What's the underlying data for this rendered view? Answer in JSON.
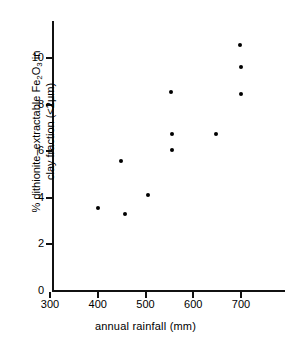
{
  "chart_data": {
    "type": "scatter",
    "title": "",
    "xlabel": "annual rainfall (mm)",
    "ylabel_line1": "% dithionite-extractable Fe2O3 in",
    "ylabel_line2": "clay fraction (<2μm)",
    "xlim": [
      280,
      770
    ],
    "ylim": [
      0,
      11.6
    ],
    "xticks": [
      300,
      400,
      500,
      600,
      700
    ],
    "xtick_labels": [
      "300",
      "400",
      "500",
      "600",
      "700"
    ],
    "yticks": [
      0,
      2,
      4,
      6,
      8,
      10
    ],
    "ytick_labels": [
      "0",
      "2",
      "4",
      "6",
      "8",
      "10"
    ],
    "grid": false,
    "legend": false,
    "marker": "filled-circle",
    "marker_color": "#000000",
    "points": [
      {
        "x": 400,
        "y": 3.55
      },
      {
        "x": 449,
        "y": 5.6
      },
      {
        "x": 458,
        "y": 3.3
      },
      {
        "x": 505,
        "y": 4.1
      },
      {
        "x": 553,
        "y": 8.55
      },
      {
        "x": 555,
        "y": 6.75
      },
      {
        "x": 555,
        "y": 6.05
      },
      {
        "x": 647,
        "y": 6.75
      },
      {
        "x": 698,
        "y": 10.55
      },
      {
        "x": 700,
        "y": 9.6
      },
      {
        "x": 700,
        "y": 8.45
      }
    ],
    "n_points": 11
  },
  "axis": {
    "x_title": "annual rainfall (mm)",
    "y_title_line1_pre": "% dithionite–extractable Fe",
    "y_title_line1_sub1": "2",
    "y_title_line1_mid": "O",
    "y_title_line1_sub2": "3",
    "y_title_line1_post": " in",
    "y_title_line2": "clay fraction (<2μm)"
  }
}
